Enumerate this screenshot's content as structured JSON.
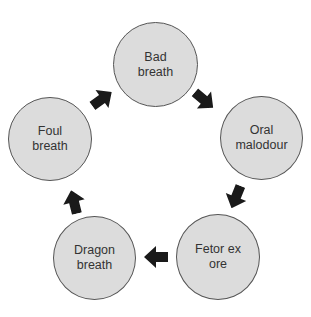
{
  "diagram": {
    "type": "cycle",
    "colors": {
      "node_fill": "#dcdcdc",
      "node_border": "#555555",
      "arrow": "#1a1a1a",
      "text": "#333333"
    },
    "nodes": [
      {
        "id": "bad-breath",
        "label": "Bad\nbreath"
      },
      {
        "id": "oral-malodour",
        "label": "Oral\nmalodour"
      },
      {
        "id": "fetor-ex-ore",
        "label": "Fetor ex\nore"
      },
      {
        "id": "dragon-breath",
        "label": "Dragon\nbreath"
      },
      {
        "id": "foul-breath",
        "label": "Foul\nbreath"
      }
    ],
    "edges": [
      {
        "from": "bad-breath",
        "to": "oral-malodour"
      },
      {
        "from": "oral-malodour",
        "to": "fetor-ex-ore"
      },
      {
        "from": "fetor-ex-ore",
        "to": "dragon-breath"
      },
      {
        "from": "dragon-breath",
        "to": "foul-breath"
      },
      {
        "from": "foul-breath",
        "to": "bad-breath"
      }
    ]
  }
}
